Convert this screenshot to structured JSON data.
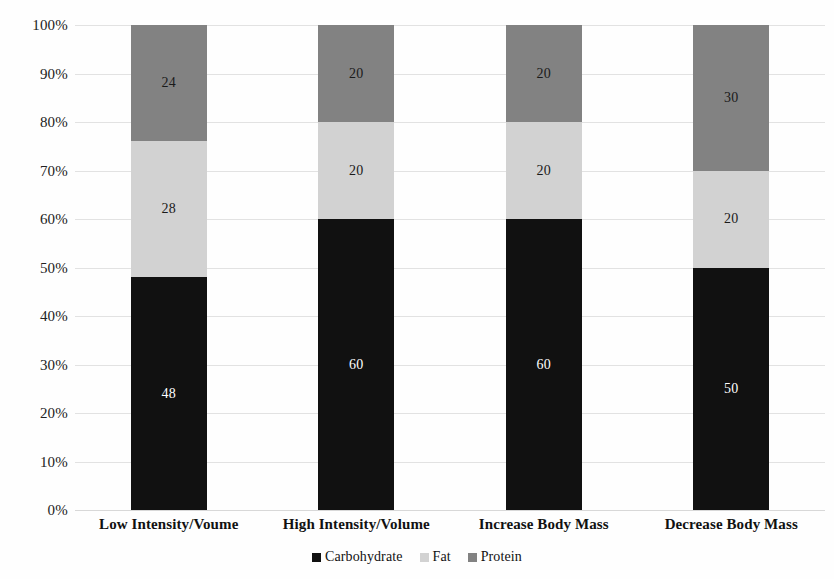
{
  "chart_data": {
    "type": "bar",
    "stacked": true,
    "normalized": true,
    "title": "",
    "xlabel": "",
    "ylabel": "",
    "ylim": [
      0,
      100
    ],
    "grid": true,
    "legend_position": "bottom",
    "categories": [
      "Low Intensity/Voume",
      "High Intensity/Volume",
      "Increase Body Mass",
      "Decrease Body Mass"
    ],
    "series": [
      {
        "name": "Carbohydrate",
        "color": "#111111",
        "label_color": "#ffffff",
        "values": [
          48,
          60,
          60,
          50
        ]
      },
      {
        "name": "Fat",
        "color": "#d2d2d2",
        "label_color": "#1a1a1a",
        "values": [
          28,
          20,
          20,
          20
        ]
      },
      {
        "name": "Protein",
        "color": "#828282",
        "label_color": "#1a1a1a",
        "values": [
          24,
          20,
          20,
          30
        ]
      }
    ],
    "y_ticks": [
      "0%",
      "10%",
      "20%",
      "30%",
      "40%",
      "50%",
      "60%",
      "70%",
      "80%",
      "90%",
      "100%"
    ],
    "y_tick_values": [
      0,
      10,
      20,
      30,
      40,
      50,
      60,
      70,
      80,
      90,
      100
    ]
  },
  "colors": {
    "gridline": "#e2e2e2",
    "background": "#fefefe",
    "text": "#1a1a1a"
  }
}
